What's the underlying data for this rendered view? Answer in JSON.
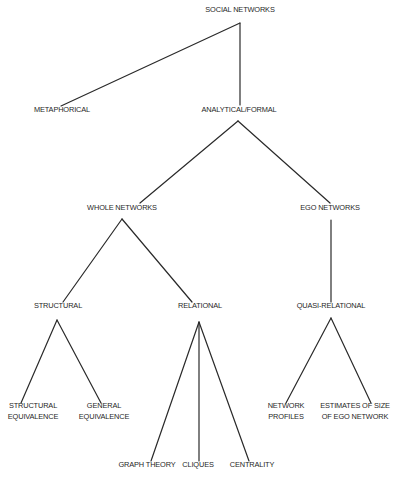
{
  "diagram": {
    "type": "tree",
    "title": "SOCIAL NETWORKS",
    "line_color": "#2a2a2a",
    "text_color": "#1f1f1f",
    "background": "#ffffff",
    "nodes": {
      "social_networks": {
        "lines": [
          "SOCIAL NETWORKS"
        ],
        "x": 240,
        "y": 9
      },
      "metaphorical": {
        "lines": [
          "METAPHORICAL"
        ],
        "x": 62,
        "y": 109
      },
      "analytical_formal": {
        "lines": [
          "ANALYTICAL/FORMAL"
        ],
        "x": 239,
        "y": 109
      },
      "whole_networks": {
        "lines": [
          "WHOLE NETWORKS"
        ],
        "x": 122,
        "y": 207
      },
      "ego_networks": {
        "lines": [
          "EGO NETWORKS"
        ],
        "x": 330,
        "y": 207
      },
      "structural": {
        "lines": [
          "STRUCTURAL"
        ],
        "x": 58,
        "y": 305
      },
      "relational": {
        "lines": [
          "RELATIONAL"
        ],
        "x": 200,
        "y": 305
      },
      "quasi_relational": {
        "lines": [
          "QUASI-RELATIONAL"
        ],
        "x": 331,
        "y": 305
      },
      "structural_equivalence": {
        "lines": [
          "STRUCTURAL",
          "EQUIVALENCE"
        ],
        "x": 33,
        "y": 405
      },
      "general_equivalence": {
        "lines": [
          "GENERAL",
          "EQUIVALENCE"
        ],
        "x": 104,
        "y": 405
      },
      "network_profiles": {
        "lines": [
          "NETWORK",
          "PROFILES"
        ],
        "x": 286,
        "y": 405
      },
      "estimates_size_ego": {
        "lines": [
          "ESTIMATES OF SIZE",
          "OF EGO NETWORK"
        ],
        "x": 355,
        "y": 405
      },
      "graph_theory": {
        "lines": [
          "GRAPH THEORY"
        ],
        "x": 147,
        "y": 464
      },
      "cliques": {
        "lines": [
          "CLIQUES"
        ],
        "x": 198,
        "y": 464
      },
      "centrality": {
        "lines": [
          "CENTRALITY"
        ],
        "x": 252,
        "y": 464
      }
    },
    "edges": [
      {
        "from": "social_networks",
        "to": "metaphorical",
        "x1": 240,
        "y1": 23,
        "x2": 61,
        "y2": 106
      },
      {
        "from": "social_networks",
        "to": "analytical_formal",
        "x1": 240,
        "y1": 23,
        "x2": 240,
        "y2": 105
      },
      {
        "from": "analytical_formal",
        "to": "whole_networks",
        "x1": 238,
        "y1": 121,
        "x2": 140,
        "y2": 203
      },
      {
        "from": "analytical_formal",
        "to": "ego_networks",
        "x1": 238,
        "y1": 121,
        "x2": 330,
        "y2": 203
      },
      {
        "from": "whole_networks",
        "to": "structural",
        "x1": 122,
        "y1": 219,
        "x2": 63,
        "y2": 302
      },
      {
        "from": "whole_networks",
        "to": "relational",
        "x1": 122,
        "y1": 219,
        "x2": 192,
        "y2": 302
      },
      {
        "from": "ego_networks",
        "to": "quasi_relational",
        "x1": 331,
        "y1": 220,
        "x2": 331,
        "y2": 302
      },
      {
        "from": "structural",
        "to": "structural_equivalence",
        "x1": 57,
        "y1": 320,
        "x2": 21,
        "y2": 403
      },
      {
        "from": "structural",
        "to": "general_equivalence",
        "x1": 57,
        "y1": 320,
        "x2": 101,
        "y2": 403
      },
      {
        "from": "relational",
        "to": "graph_theory",
        "x1": 199,
        "y1": 322,
        "x2": 151,
        "y2": 461
      },
      {
        "from": "relational",
        "to": "cliques",
        "x1": 199,
        "y1": 322,
        "x2": 199,
        "y2": 461
      },
      {
        "from": "relational",
        "to": "centrality",
        "x1": 199,
        "y1": 322,
        "x2": 249,
        "y2": 461
      },
      {
        "from": "quasi_relational",
        "to": "network_profiles",
        "x1": 331,
        "y1": 318,
        "x2": 286,
        "y2": 403
      },
      {
        "from": "quasi_relational",
        "to": "estimates_size_ego",
        "x1": 331,
        "y1": 318,
        "x2": 371,
        "y2": 403
      }
    ]
  }
}
